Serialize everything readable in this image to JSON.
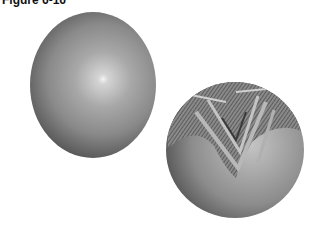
{
  "figure": {
    "title": "Figure 6-16"
  },
  "spheres": [
    {
      "name": "plain-shaded-sphere",
      "shading": "smooth gray with specular highlight",
      "highlight_color": "#f4f4f4",
      "base_color": "#8a8a8a"
    },
    {
      "name": "texture-mapped-sphere",
      "shading": "gray with patterned texture on upper portion",
      "base_color": "#8c8c8c",
      "texture_color": "#3a3a3a"
    }
  ]
}
